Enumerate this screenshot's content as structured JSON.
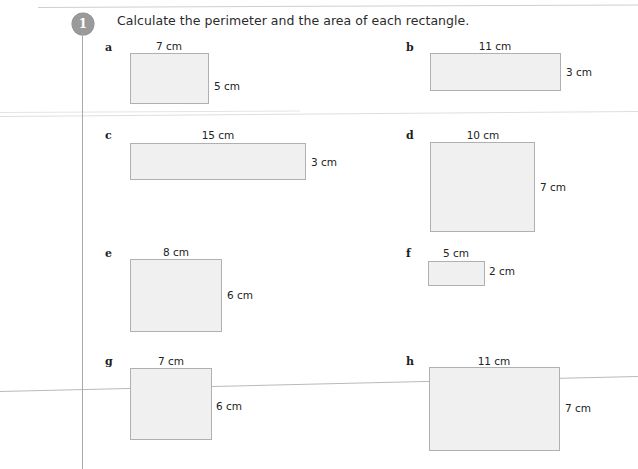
{
  "worksheet": {
    "question_number": "1",
    "title": "Calculate the perimeter and the area of each rectangle.",
    "unit": "cm",
    "rect_fill": "#f0f0f0",
    "rect_border": "#b0b0b0",
    "badge_color": "#9a9a9a"
  },
  "items": [
    {
      "letter": "a",
      "width_label": "7 cm",
      "height_label": "5 cm",
      "width_cm": 7,
      "height_cm": 5
    },
    {
      "letter": "b",
      "width_label": "11 cm",
      "height_label": "3 cm",
      "width_cm": 11,
      "height_cm": 3
    },
    {
      "letter": "c",
      "width_label": "15 cm",
      "height_label": "3 cm",
      "width_cm": 15,
      "height_cm": 3
    },
    {
      "letter": "d",
      "width_label": "10 cm",
      "height_label": "7 cm",
      "width_cm": 10,
      "height_cm": 7
    },
    {
      "letter": "e",
      "width_label": "8 cm",
      "height_label": "6 cm",
      "width_cm": 8,
      "height_cm": 6
    },
    {
      "letter": "f",
      "width_label": "5 cm",
      "height_label": "2 cm",
      "width_cm": 5,
      "height_cm": 2
    },
    {
      "letter": "g",
      "width_label": "7 cm",
      "height_label": "6 cm",
      "width_cm": 7,
      "height_cm": 6
    },
    {
      "letter": "h",
      "width_label": "11 cm",
      "height_label": "7 cm",
      "width_cm": 11,
      "height_cm": 7
    }
  ]
}
